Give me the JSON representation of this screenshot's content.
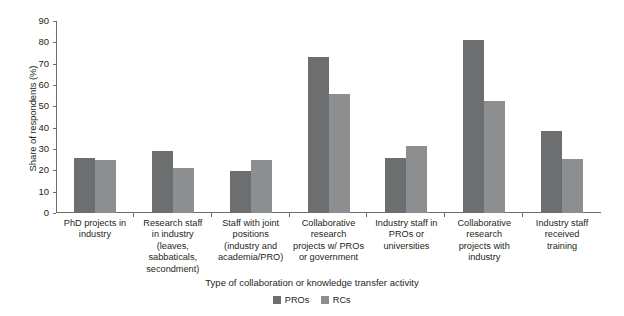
{
  "chart_data": {
    "type": "bar",
    "title": "",
    "subtitle": "",
    "xlabel": "Type of collaboration or knowledge transfer activity",
    "ylabel": "Share of respondents (%)",
    "ylim": [
      0,
      90
    ],
    "yticks": [
      0,
      10,
      20,
      30,
      40,
      50,
      60,
      70,
      80,
      90
    ],
    "grid": false,
    "legend_position": "bottom-center",
    "categories": [
      "PhD projects in industry",
      "Research staff in industry (leaves, sabbaticals, secondment)",
      "Staff with joint positions (industry and academia/PRO)",
      "Collaborative research projects w/ PROs or government",
      "Industry staff in PROs or universities",
      "Collaborative research projects with industry",
      "Industry staff received training"
    ],
    "category_lines": [
      [
        "PhD projects in",
        "industry"
      ],
      [
        "Research staff",
        "in industry",
        "(leaves, sabbaticals,",
        "secondment)"
      ],
      [
        "Staff with joint",
        "positions",
        "(industry and",
        "academia/PRO)"
      ],
      [
        "Collaborative",
        "research",
        "projects w/ PROs",
        "or government"
      ],
      [
        "Industry staff in",
        "PROs or",
        "universities"
      ],
      [
        "Collaborative",
        "research",
        "projects with",
        "industry"
      ],
      [
        "Industry staff",
        "received",
        "training"
      ]
    ],
    "series": [
      {
        "name": "PROs",
        "color": "#6d6e70",
        "values": [
          26,
          29,
          19.5,
          73,
          26,
          81,
          38.5
        ]
      },
      {
        "name": "RCs",
        "color": "#8d8e90",
        "values": [
          25,
          21,
          25,
          56,
          31.5,
          52.5,
          25.5
        ]
      }
    ]
  },
  "legend": {
    "entries": [
      {
        "label": "PROs",
        "color": "#6d6e70"
      },
      {
        "label": "RCs",
        "color": "#8d8e90"
      }
    ]
  },
  "colors": {
    "pros": "#6d6e70",
    "rcs": "#8d8e90",
    "axis": "#6d6e70",
    "text": "#231f20",
    "background": "#ffffff"
  }
}
